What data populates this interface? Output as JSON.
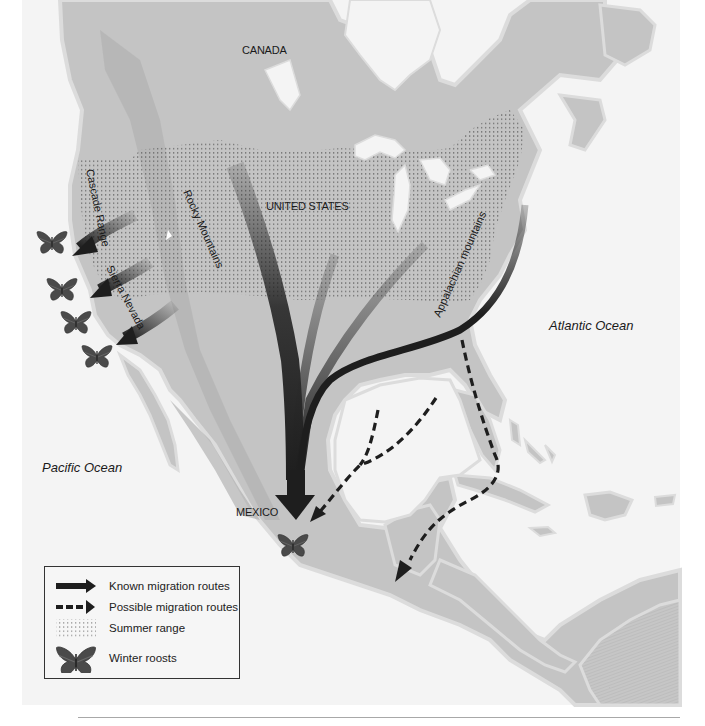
{
  "labels": {
    "canada": "CANADA",
    "united_states": "UNITED STATES",
    "mexico": "MEXICO",
    "pacific_ocean": "Pacific Ocean",
    "atlantic_ocean": "Atlantic Ocean",
    "cascade_range": "Cascade Range",
    "sierra_nevada": "Sierra Nevada",
    "rocky_mountains": "Rocky Mountains",
    "appalachian_mountains": "Appalachian mountains"
  },
  "legend": {
    "items": [
      {
        "symbol": "solid-arrow",
        "label": "Known migration routes"
      },
      {
        "symbol": "dashed-arrow",
        "label": "Possible migration routes"
      },
      {
        "symbol": "dot-pattern",
        "label": "Summer range"
      },
      {
        "symbol": "butterfly",
        "label": "Winter roosts"
      }
    ]
  },
  "colors": {
    "ocean": "#f4f4f4",
    "land": "#c4c4c4",
    "land_dark": "#b2b2b2",
    "coast_halo": "#dcdcdc",
    "arrow": "#1e1e1e",
    "butterfly": "#4a4a4a",
    "text": "#1a1a1a"
  },
  "winter_roosts": [
    {
      "name": "california-roost-1",
      "x": 52,
      "y": 240
    },
    {
      "name": "california-roost-2",
      "x": 62,
      "y": 287
    },
    {
      "name": "california-roost-3",
      "x": 76,
      "y": 320
    },
    {
      "name": "california-roost-4",
      "x": 97,
      "y": 354
    },
    {
      "name": "mexico-roost",
      "x": 293,
      "y": 543
    }
  ]
}
